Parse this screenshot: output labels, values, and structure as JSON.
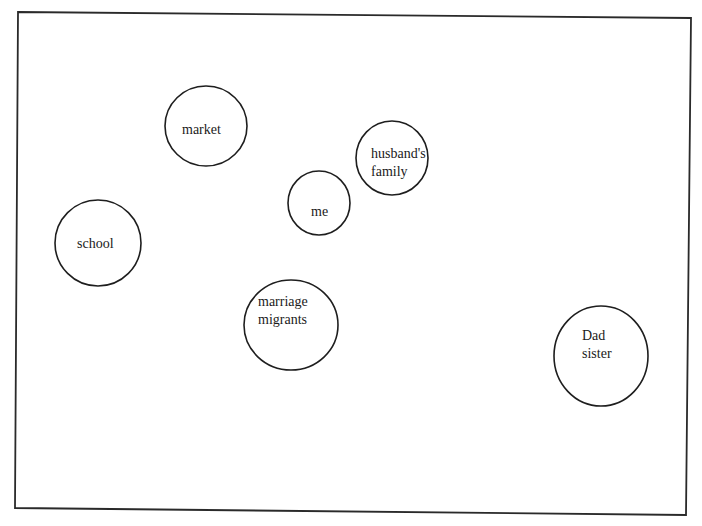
{
  "diagram": {
    "type": "social-network-map",
    "frame": {
      "points": [
        [
          18,
          12
        ],
        [
          691,
          18
        ],
        [
          686,
          515
        ],
        [
          15,
          508
        ]
      ],
      "stroke": "#2a2a2a"
    },
    "nodes": [
      {
        "id": "market",
        "lines": [
          "market"
        ],
        "cx": 206,
        "cy": 126,
        "rx": 41,
        "ry": 40,
        "text_x": 182,
        "text_y": 134
      },
      {
        "id": "husbands-family",
        "lines": [
          "husband's",
          "family"
        ],
        "cx": 392,
        "cy": 158,
        "rx": 36,
        "ry": 37,
        "text_x": 371,
        "text_y": 158
      },
      {
        "id": "me",
        "lines": [
          "me"
        ],
        "cx": 319,
        "cy": 203,
        "rx": 31,
        "ry": 32,
        "text_x": 311,
        "text_y": 216
      },
      {
        "id": "school",
        "lines": [
          "school"
        ],
        "cx": 98,
        "cy": 243,
        "rx": 43,
        "ry": 43,
        "text_x": 77,
        "text_y": 248
      },
      {
        "id": "marriage-migrants",
        "lines": [
          "marriage",
          "migrants"
        ],
        "cx": 291,
        "cy": 325,
        "rx": 47,
        "ry": 45,
        "text_x": 258,
        "text_y": 306
      },
      {
        "id": "dad-sister",
        "lines": [
          "Dad",
          "sister"
        ],
        "cx": 601,
        "cy": 356,
        "rx": 47,
        "ry": 50,
        "text_x": 582,
        "text_y": 340
      }
    ],
    "line_height": 18
  }
}
